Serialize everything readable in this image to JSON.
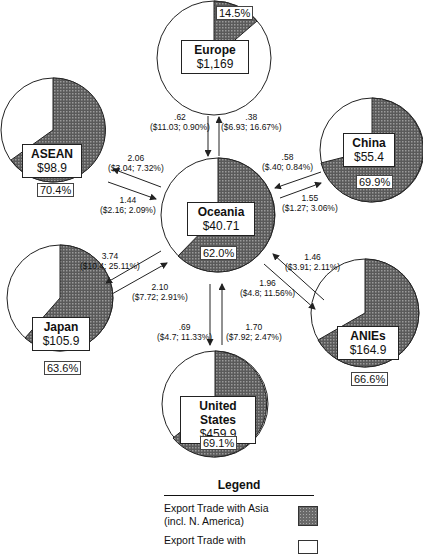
{
  "regions": {
    "europe": {
      "name": "Europe",
      "value": "$1,169",
      "pct": "14.5%"
    },
    "asean": {
      "name": "ASEAN",
      "value": "$98.9",
      "pct": "70.4%"
    },
    "china": {
      "name": "China",
      "value": "$55.4",
      "pct": "69.9%"
    },
    "oceania": {
      "name": "Oceania",
      "value": "$40.71",
      "pct": "62.0%"
    },
    "japan": {
      "name": "Japan",
      "value": "$105.9",
      "pct": "63.6%"
    },
    "anies": {
      "name": "ANIEs",
      "value": "$164.9",
      "pct": "66.6%"
    },
    "us": {
      "name": "United States",
      "value": "$459.9",
      "pct": "69.1%"
    }
  },
  "flows": {
    "to_europe_in": {
      "v": ".62",
      "d": "($11.03; 0.90%)"
    },
    "to_europe_out": {
      "v": ".38",
      "d": "($6.93; 16.67%)"
    },
    "asean_a": {
      "v": "2.06",
      "d": "($3.04; 7.32%)"
    },
    "asean_b": {
      "v": "1.44",
      "d": "($2.16; 2.09%)"
    },
    "china_a": {
      "v": ".58",
      "d": "($.40; 0.84%)"
    },
    "china_b": {
      "v": "1.55",
      "d": "($1.27; 3.06%)"
    },
    "japan_a": {
      "v": "3.74",
      "d": "($10.4; 25.11%)"
    },
    "japan_b": {
      "v": "2.10",
      "d": "($7.72; 2.91%)"
    },
    "anies_a": {
      "v": "1.46",
      "d": "($3.91; 2.11%)"
    },
    "anies_b": {
      "v": "1.96",
      "d": "($4.8; 11.56%)"
    },
    "us_a": {
      "v": ".69",
      "d": "($4.7; 11.33%)"
    },
    "us_b": {
      "v": "1.70",
      "d": "($7.92; 2.47%)"
    }
  },
  "legend": {
    "title": "Legend",
    "asia": "Export Trade with Asia (incl. N. America)",
    "other": "Export Trade with"
  }
}
